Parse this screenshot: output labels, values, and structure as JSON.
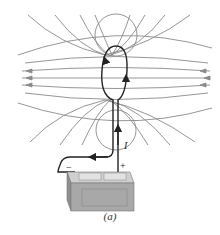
{
  "figure": {
    "caption": "(a)",
    "current_label": "I",
    "plus_label": "+",
    "minus_label": "−",
    "colors": {
      "field_line": "#8a8a8a",
      "loop": "#222222",
      "battery_body": "#a8a8a8",
      "battery_top": "#cfcfcf"
    }
  }
}
